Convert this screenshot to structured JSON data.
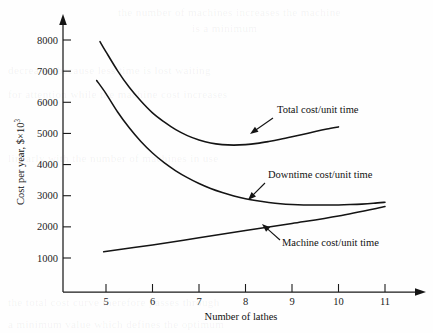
{
  "chart_data": {
    "type": "line",
    "title": "",
    "xlabel": "Number of lathes",
    "ylabel": "Cost per year, $×10",
    "ylabel_exponent": "3",
    "xlim": [
      4.3,
      11.9
    ],
    "ylim": [
      0,
      8600
    ],
    "grid": false,
    "legend_position": "inline-annotations",
    "xticks": [
      5,
      6,
      7,
      8,
      9,
      10,
      11
    ],
    "xtick_labels": [
      "5",
      "6",
      "7",
      "8",
      "9",
      "10",
      "11"
    ],
    "yticks": [
      1000,
      2000,
      3000,
      4000,
      5000,
      6000,
      7000,
      8000
    ],
    "ytick_labels": [
      "1000",
      "2000",
      "3000",
      "4000",
      "5000",
      "6000",
      "7000",
      "8000"
    ],
    "series": [
      {
        "name": "Total cost/unit time",
        "x": [
          4.87,
          5.0,
          5.25,
          5.5,
          5.75,
          6.0,
          6.25,
          6.5,
          6.75,
          7.0,
          7.25,
          7.5,
          7.75,
          8.0,
          8.25,
          8.5,
          8.75,
          9.0,
          9.25,
          9.5,
          9.75,
          10.0
        ],
        "values": [
          7950,
          7620,
          7010,
          6480,
          6040,
          5660,
          5370,
          5120,
          4930,
          4790,
          4690,
          4640,
          4625,
          4640,
          4680,
          4740,
          4810,
          4890,
          4975,
          5060,
          5140,
          5210
        ]
      },
      {
        "name": "Downtime cost/unit time",
        "x": [
          4.8,
          5.0,
          5.25,
          5.5,
          5.75,
          6.0,
          6.25,
          6.5,
          6.75,
          7.0,
          7.25,
          7.5,
          7.75,
          8.0,
          8.25,
          8.5,
          8.75,
          9.0,
          9.25,
          9.5,
          9.75,
          10.0,
          10.25,
          10.5,
          10.75,
          11.0
        ],
        "values": [
          6700,
          6280,
          5690,
          5180,
          4740,
          4370,
          4060,
          3800,
          3580,
          3390,
          3230,
          3100,
          2990,
          2900,
          2835,
          2785,
          2745,
          2720,
          2705,
          2700,
          2700,
          2705,
          2715,
          2730,
          2755,
          2790
        ]
      },
      {
        "name": "Machine cost/unit time",
        "x": [
          4.95,
          6.0,
          7.0,
          8.0,
          9.0,
          10.0,
          11.0
        ],
        "values": [
          1200,
          1420,
          1650,
          1880,
          2110,
          2350,
          2650
        ]
      }
    ],
    "annotations": [
      {
        "text": "Total cost/unit time",
        "label_x": 277,
        "label_y": 113,
        "arrow_from_x": 273,
        "arrow_from_y": 118,
        "arrow_to_x": 250,
        "arrow_to_y": 134
      },
      {
        "text": "Downtime cost/unit time",
        "label_x": 268,
        "label_y": 178,
        "arrow_from_x": 265,
        "arrow_from_y": 183,
        "arrow_to_x": 248,
        "arrow_to_y": 200
      },
      {
        "text": "Machine cost/unit time",
        "label_x": 282,
        "label_y": 246,
        "arrow_from_x": 280,
        "arrow_from_y": 240,
        "arrow_to_x": 262,
        "arrow_to_y": 224
      }
    ]
  },
  "page": {
    "ghost_lines": [
      "the number of machines increases the machine",
      "is a minimum",
      "decreases because less time is lost waiting",
      "for attention while the machine cost increases",
      "linearly with the number of machines in use",
      "the total cost curve therefore passes through",
      "a minimum value which defines the optimum"
    ]
  }
}
